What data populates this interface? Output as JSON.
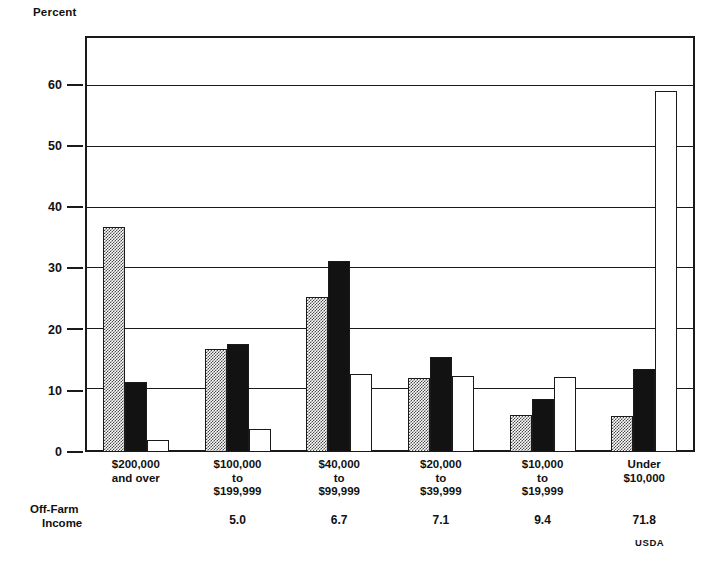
{
  "chart_data": {
    "type": "bar",
    "title": "",
    "ylabel": "Percent",
    "xlabel": "",
    "ylim": [
      0,
      68
    ],
    "yticks": [
      0,
      10,
      20,
      30,
      40,
      50,
      60
    ],
    "grid": true,
    "legend_position": "none",
    "categories": [
      "$200,000\nand over",
      "$100,000\nto\n$199,999",
      "$40,000\nto\n$99,999",
      "$20,000\nto\n$39,999",
      "$10,000\nto\n$19,999",
      "Under\n$10,000"
    ],
    "series": [
      {
        "name": "hatched",
        "values": [
          36.8,
          16.8,
          25.3,
          12.1,
          6.1,
          5.9
        ]
      },
      {
        "name": "solid-black",
        "values": [
          11.5,
          17.7,
          31.3,
          15.6,
          8.6,
          13.6
        ]
      },
      {
        "name": "open-white",
        "values": [
          2.0,
          3.8,
          12.7,
          12.5,
          12.2,
          59.0
        ]
      }
    ],
    "annotation_row": {
      "label_line1": "Off-Farm",
      "label_line2": "Income",
      "values": [
        "",
        "5.0",
        "6.7",
        "7.1",
        "9.4",
        "71.8"
      ]
    },
    "source": "USDA"
  },
  "axis": {
    "ylabel": "Percent",
    "ticks": [
      {
        "value": 60,
        "label": "60"
      },
      {
        "value": 50,
        "label": "50"
      },
      {
        "value": 40,
        "label": "40"
      },
      {
        "value": 30,
        "label": "30"
      },
      {
        "value": 20,
        "label": "20"
      },
      {
        "value": 10,
        "label": "10"
      },
      {
        "value": 0,
        "label": "0"
      }
    ]
  },
  "categories": [
    {
      "l1": "$200,000",
      "l2": "and over",
      "l3": ""
    },
    {
      "l1": "$100,000",
      "l2": "to",
      "l3": "$199,999"
    },
    {
      "l1": "$40,000",
      "l2": "to",
      "l3": "$99,999"
    },
    {
      "l1": "$20,000",
      "l2": "to",
      "l3": "$39,999"
    },
    {
      "l1": "$10,000",
      "l2": "to",
      "l3": "$19,999"
    },
    {
      "l1": "Under",
      "l2": "$10,000",
      "l3": ""
    }
  ],
  "offfarm": {
    "label_line1": "Off-Farm",
    "label_line2": "Income",
    "v0": "",
    "v1": "5.0",
    "v2": "6.7",
    "v3": "7.1",
    "v4": "9.4",
    "v5": "71.8"
  },
  "source": {
    "text": "USDA"
  },
  "colors": {
    "ink": "#1a1a1a",
    "solid_bar": "#121212",
    "hatch": "#4a4a4a",
    "background": "#ffffff"
  }
}
